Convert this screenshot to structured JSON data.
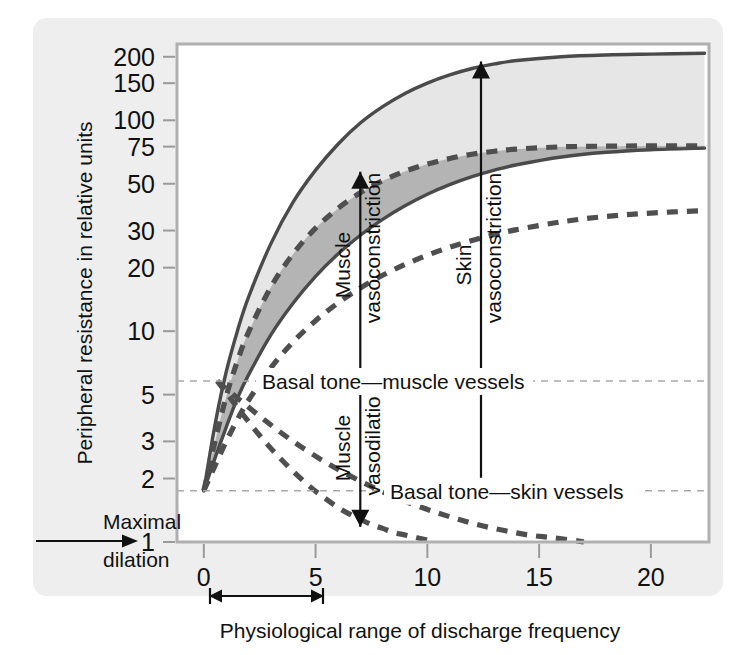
{
  "figure": {
    "background_color": "#eeeeee",
    "plot_background_color": "#ffffff"
  },
  "chart_data": {
    "type": "line",
    "title": "",
    "xlabel": "Physiological range of discharge frequency",
    "ylabel": "Peripheral resistance in relative units",
    "xlim": [
      -1.2,
      22.6
    ],
    "ylim": [
      1,
      230
    ],
    "yscale": "log",
    "xscale": "linear",
    "grid": "horizontal-reference-lines-only",
    "legend_position": "none",
    "yticks": [
      1,
      2,
      3,
      5,
      10,
      20,
      30,
      50,
      75,
      100,
      150,
      200
    ],
    "ytick_labels": [
      "1",
      "2",
      "3",
      "5",
      "10",
      "20",
      "30",
      "50",
      "75",
      "100",
      "150",
      "200"
    ],
    "xticks": [
      0,
      5,
      10,
      15,
      20
    ],
    "xtick_labels": [
      "0",
      "5",
      "10",
      "15",
      "20"
    ],
    "origin_point": {
      "x": 0.0,
      "y": 1.75
    },
    "reference_lines": [
      {
        "name": "basal-tone-muscle",
        "value": 5.8,
        "label": "Basal tone—muscle vessels",
        "style": "dashed"
      },
      {
        "name": "basal-tone-skin",
        "value": 1.75,
        "label": "Basal tone—skin vessels",
        "style": "dashed"
      }
    ],
    "series": [
      {
        "name": "muscle-vasoconstriction-upper-bound",
        "style": "solid",
        "x": [
          0.0,
          0.5,
          1.0,
          1.5,
          2.0,
          3.0,
          4.0,
          5.0,
          6.0,
          7.0,
          8.0,
          9.0,
          10.0,
          11.0,
          12.0,
          13.0,
          14.0,
          16.0,
          18.0,
          20.0,
          22.4
        ],
        "y": [
          1.75,
          3.6,
          6.4,
          10.0,
          14.5,
          26.0,
          41.0,
          58.0,
          77.0,
          97.0,
          116.0,
          134.0,
          150.0,
          164.0,
          176.0,
          185.0,
          192.0,
          200.0,
          204.0,
          206.0,
          208.0
        ]
      },
      {
        "name": "muscle-vasoconstriction-mean",
        "style": "dashed",
        "x": [
          0.0,
          0.5,
          1.0,
          1.5,
          2.0,
          3.0,
          4.0,
          5.0,
          6.0,
          7.0,
          8.0,
          9.0,
          10.0,
          11.0,
          12.0,
          13.0,
          14.0,
          16.0,
          18.0,
          20.0,
          22.4
        ],
        "y": [
          1.75,
          3.0,
          4.9,
          7.2,
          9.9,
          16.2,
          23.3,
          30.8,
          38.2,
          45.3,
          51.7,
          57.3,
          62.0,
          65.9,
          69.0,
          71.3,
          73.0,
          74.8,
          75.4,
          75.6,
          75.7
        ]
      },
      {
        "name": "muscle-vasoconstriction-lower-bound",
        "style": "solid",
        "x": [
          0.0,
          0.5,
          1.0,
          1.5,
          2.0,
          3.0,
          4.0,
          5.0,
          6.0,
          7.0,
          8.0,
          9.0,
          10.0,
          11.0,
          12.0,
          13.0,
          14.0,
          16.0,
          18.0,
          20.0,
          22.4
        ],
        "y": [
          1.75,
          2.5,
          3.5,
          4.8,
          6.2,
          9.6,
          13.6,
          18.2,
          23.2,
          28.5,
          33.9,
          39.3,
          44.6,
          49.5,
          54.0,
          58.0,
          61.5,
          67.0,
          70.5,
          72.5,
          73.8
        ]
      },
      {
        "name": "skin-vasoconstriction",
        "style": "dashed",
        "x": [
          0.0,
          0.5,
          1.0,
          1.5,
          2.0,
          3.0,
          4.0,
          5.0,
          6.0,
          7.0,
          8.0,
          9.0,
          10.0,
          11.0,
          12.0,
          13.0,
          14.0,
          16.0,
          18.0,
          20.0,
          22.4
        ],
        "y": [
          1.75,
          2.3,
          3.0,
          3.8,
          4.7,
          6.7,
          8.9,
          11.2,
          13.6,
          16.0,
          18.4,
          20.7,
          22.9,
          25.0,
          26.9,
          28.7,
          30.3,
          33.0,
          35.0,
          36.3,
          37.3
        ]
      },
      {
        "name": "muscle-vasodilation-inner",
        "style": "dashed",
        "x": [
          0.6,
          1.0,
          1.5,
          2.0,
          2.5,
          3.0,
          3.5,
          4.0,
          4.5,
          5.0,
          5.5,
          6.0,
          6.5,
          7.0,
          7.5,
          8.0,
          8.5,
          9.0,
          9.5,
          10.0
        ],
        "y": [
          5.8,
          5.1,
          4.35,
          3.72,
          3.2,
          2.78,
          2.44,
          2.16,
          1.93,
          1.74,
          1.59,
          1.46,
          1.36,
          1.28,
          1.21,
          1.16,
          1.11,
          1.08,
          1.05,
          1.02
        ]
      },
      {
        "name": "skin-vasodilation-outer",
        "style": "dashed",
        "x": [
          0.6,
          1.5,
          2.5,
          3.5,
          4.5,
          5.5,
          6.5,
          7.5,
          8.5,
          9.5,
          10.5,
          11.5,
          12.5,
          13.5,
          14.5,
          15.5,
          16.5,
          17.0
        ],
        "y": [
          5.8,
          4.82,
          3.95,
          3.27,
          2.76,
          2.37,
          2.07,
          1.83,
          1.64,
          1.49,
          1.37,
          1.27,
          1.19,
          1.13,
          1.08,
          1.05,
          1.02,
          1.0
        ]
      }
    ],
    "bands": [
      {
        "name": "muscle-vasoconstriction-light-band",
        "upper": "muscle-vasoconstriction-upper-bound",
        "lower": "muscle-vasoconstriction-mean",
        "color": "#e6e6e6"
      },
      {
        "name": "muscle-vasoconstriction-dark-band",
        "upper": "muscle-vasoconstriction-mean",
        "lower": "muscle-vasoconstriction-lower-bound",
        "color": "#b4b4b4"
      }
    ],
    "annotations": [
      {
        "name": "muscle-vasoconstriction",
        "text": "Muscle",
        "text2": "vasoconstriction",
        "x": 7.0,
        "y_from": 5.8,
        "y_to": 57.0,
        "arrow": "up"
      },
      {
        "name": "muscle-vasodilation",
        "text": "Muscle",
        "text2": "vasodilation",
        "x": 7.0,
        "y_from": 5.8,
        "y_to": 1.18,
        "arrow": "down"
      },
      {
        "name": "skin-vasoconstriction",
        "text": "Skin",
        "text2": "vasoconstriction",
        "x": 12.4,
        "y_from": 1.75,
        "y_to": 190.0,
        "arrow": "up"
      },
      {
        "name": "basal-tone-muscle-vessels",
        "text": "Basal tone—muscle vessels",
        "y": 5.8
      },
      {
        "name": "basal-tone-skin-vessels",
        "text": "Basal tone—skin vessels",
        "y": 1.75
      },
      {
        "name": "maximal-dilation",
        "text_line1": "Maximal",
        "text_line2": "dilation",
        "target": "1"
      },
      {
        "name": "physiological-range",
        "text": "Physiological range of discharge frequency",
        "x_from": 0,
        "x_to": 10
      }
    ]
  }
}
